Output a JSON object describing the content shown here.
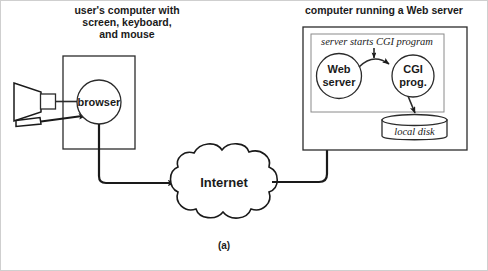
{
  "figure": {
    "caption": "(a)",
    "ink_color": "#1a1a1a",
    "background_color": "#ffffff"
  },
  "left_section": {
    "title_line1": "user's computer with",
    "title_line2": "screen, keyboard,",
    "title_line3": "and mouse",
    "computer_box_name": "user-computer-box",
    "browser_node": {
      "label": "browser",
      "shape": "circle"
    },
    "peripherals": [
      {
        "name": "monitor",
        "shape": "trapezoid-with-square"
      },
      {
        "name": "mouse",
        "shape": "slanted-quad"
      }
    ]
  },
  "network": {
    "cloud_label": "Internet",
    "shape": "cloud"
  },
  "right_section": {
    "title": "computer running a Web server",
    "annotation": "server starts CGI program",
    "web_server_node": {
      "label_line1": "Web",
      "label_line2": "server",
      "shape": "circle"
    },
    "cgi_node": {
      "label_line1": "CGI",
      "label_line2": "prog.",
      "shape": "circle"
    },
    "disk_node": {
      "label": "local disk",
      "shape": "cylinder"
    }
  },
  "connections": [
    {
      "from": "monitor",
      "to": "browser",
      "arrow": false
    },
    {
      "from": "mouse",
      "to": "browser",
      "arrow": true
    },
    {
      "from": "browser",
      "to": "internet",
      "arrow": true
    },
    {
      "from": "internet",
      "to": "web-server",
      "arrow": true
    },
    {
      "from": "web-server",
      "to": "cgi-prog",
      "arrow": true
    },
    {
      "from": "cgi-prog",
      "to": "local-disk",
      "arrow": true
    }
  ]
}
